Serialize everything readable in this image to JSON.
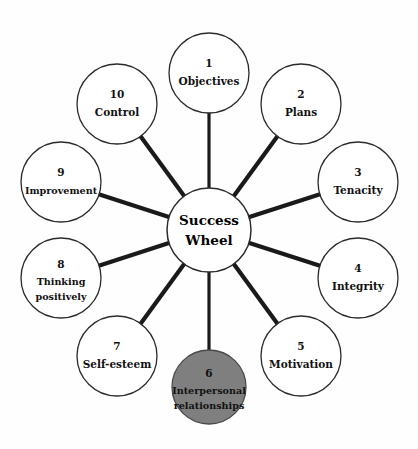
{
  "diagram": {
    "title": "Success Wheel",
    "center": {
      "line1": "Success",
      "line2": "Wheel"
    },
    "colors": {
      "background": "#fefefe",
      "node_fill": "#ffffff",
      "node_stroke": "#2b2b2b",
      "highlight_fill": "#7f7f7f",
      "spoke": "#1a1a1a",
      "text": "#111111"
    },
    "nodes": [
      {
        "number": "1",
        "label_line1": "Objectives",
        "label_line2": "",
        "highlighted": false
      },
      {
        "number": "2",
        "label_line1": "Plans",
        "label_line2": "",
        "highlighted": false
      },
      {
        "number": "3",
        "label_line1": "Tenacity",
        "label_line2": "",
        "highlighted": false
      },
      {
        "number": "4",
        "label_line1": "Integrity",
        "label_line2": "",
        "highlighted": false
      },
      {
        "number": "5",
        "label_line1": "Motivation",
        "label_line2": "",
        "highlighted": false
      },
      {
        "number": "6",
        "label_line1": "Interpersonal",
        "label_line2": "relationships",
        "highlighted": true
      },
      {
        "number": "7",
        "label_line1": "Self-esteem",
        "label_line2": "",
        "highlighted": false
      },
      {
        "number": "8",
        "label_line1": "Thinking",
        "label_line2": "positively",
        "highlighted": false
      },
      {
        "number": "9",
        "label_line1": "Improvement",
        "label_line2": "",
        "highlighted": false
      },
      {
        "number": "10",
        "label_line1": "Control",
        "label_line2": "",
        "highlighted": false
      }
    ]
  }
}
